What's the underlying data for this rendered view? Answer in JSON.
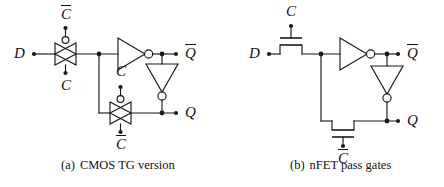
{
  "figure": {
    "type": "circuit-schematic",
    "panels": [
      {
        "tag": "(a)",
        "caption": "CMOS TG version",
        "topology": "D feeds a CMOS transmission gate into a forward inverter producing Qbar; a feedback inverter returns through a second transmission gate to the storage node producing Q",
        "labels": {
          "input": "D",
          "out_qbar_base": "Q",
          "out_q": "Q",
          "tg1_top": "C",
          "tg1_bottom": "C",
          "tg2_top": "C",
          "tg2_bottom": "C"
        },
        "devices": [
          "transmission-gate",
          "inverter",
          "feedback-inverter",
          "transmission-gate"
        ]
      },
      {
        "tag": "(b)",
        "caption": "nFET pass gates",
        "topology": "D passes through an nFET pass transistor into a forward inverter producing Qbar; a feedback inverter returns through a second nFET pass transistor producing Q",
        "labels": {
          "input": "D",
          "out_qbar_base": "Q",
          "out_q": "Q",
          "nfet_top_gate": "C",
          "nfet_bottom_gate": "C"
        },
        "devices": [
          "nfet-pass-gate",
          "inverter",
          "feedback-inverter",
          "nfet-pass-gate"
        ]
      }
    ],
    "colors": {
      "ink": "#1a1a1a",
      "background": "#ffffff"
    }
  }
}
